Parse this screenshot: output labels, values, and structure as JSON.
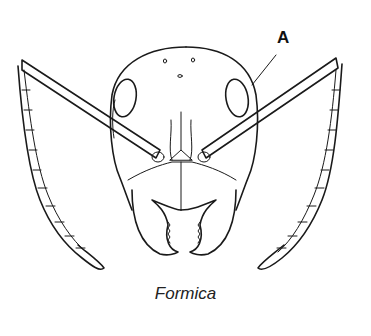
{
  "figure": {
    "label": "A",
    "caption": "Formica",
    "line_color": "#1a1a1a",
    "background": "#ffffff"
  }
}
